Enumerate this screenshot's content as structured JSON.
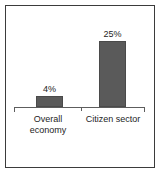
{
  "chart_data": {
    "type": "bar",
    "title": "",
    "subtitle": "",
    "xlabel": "",
    "ylabel": "",
    "categories": [
      "Overall economy",
      "Citizen sector"
    ],
    "category_lines": [
      [
        "Overall",
        "economy"
      ],
      [
        "Citizen sector"
      ]
    ],
    "values": [
      4,
      25
    ],
    "value_labels": [
      "4%",
      "25%"
    ],
    "units": "percent",
    "ylim": [
      0,
      27
    ],
    "grid": false,
    "legend": false,
    "axis": {
      "orientation": "horizontal",
      "ticks_at_ends": true,
      "center_divider_tick": true
    }
  },
  "style": {
    "bar_fill": "#5a5a5a",
    "bar_edge": "#4a4a4a",
    "axis_color": "#5d5d5d",
    "text_color": "#1d1d1d",
    "frame_color": "#3b3b3b",
    "background": "#ffffff"
  }
}
